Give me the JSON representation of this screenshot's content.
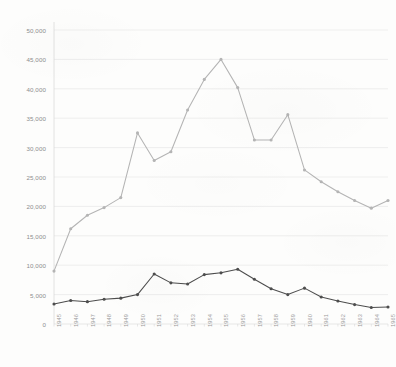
{
  "chart_data": {
    "type": "line",
    "title": "",
    "xlabel": "",
    "ylabel": "",
    "ylim": [
      0,
      50000
    ],
    "ytick_step": 5000,
    "grid": true,
    "legend": "none",
    "yticks": [
      "0",
      "5,000",
      "10,000",
      "15,000",
      "20,000",
      "25,000",
      "30,000",
      "35,000",
      "40,000",
      "45,000",
      "50,000"
    ],
    "ytick_values": [
      0,
      5000,
      10000,
      15000,
      20000,
      25000,
      30000,
      35000,
      40000,
      45000,
      50000
    ],
    "categories": [
      "1945",
      "1946",
      "1947",
      "1948",
      "1949",
      "1950",
      "1951",
      "1952",
      "1953",
      "1954",
      "1955",
      "1956",
      "1957",
      "1958",
      "1959",
      "1960",
      "1961",
      "1962",
      "1963",
      "1964",
      "1965"
    ],
    "series": [
      {
        "name": "upper-series",
        "color": "#b4b4b4",
        "values": [
          9000,
          16200,
          18500,
          19800,
          21500,
          32500,
          27800,
          29300,
          36400,
          41600,
          45000,
          40200,
          31300,
          31300,
          35600,
          26200,
          24200,
          22500,
          21000,
          19700,
          21000
        ]
      },
      {
        "name": "lower-series",
        "color": "#4d4d4d",
        "values": [
          3400,
          4000,
          3800,
          4200,
          4400,
          5000,
          8500,
          7000,
          6800,
          8400,
          8700,
          9300,
          7600,
          6000,
          5000,
          6100,
          4600,
          3900,
          3300,
          2800,
          2900
        ]
      }
    ]
  }
}
